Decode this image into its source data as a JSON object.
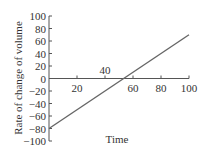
{
  "chart_data": {
    "type": "line",
    "title": "",
    "xlabel": "Time",
    "ylabel": "Rate of change of volume",
    "xlim": [
      0,
      100
    ],
    "ylim": [
      -100,
      100
    ],
    "x_ticks": [
      20,
      40,
      60,
      80,
      100
    ],
    "y_ticks": [
      100,
      80,
      60,
      40,
      20,
      0,
      -20,
      -40,
      -60,
      -80,
      -100
    ],
    "x_tick_labels": [
      "20",
      "40",
      "60",
      "80",
      "100"
    ],
    "y_tick_labels": [
      "100",
      "80",
      "60",
      "40",
      "20",
      "0",
      "−20",
      "−40",
      "−60",
      "−80",
      "−100"
    ],
    "grid": false,
    "legend": null,
    "series": [
      {
        "name": "Rate of change of volume",
        "x": [
          0,
          100
        ],
        "y": [
          -80,
          70
        ],
        "color": "#666666"
      }
    ],
    "annotations": []
  }
}
